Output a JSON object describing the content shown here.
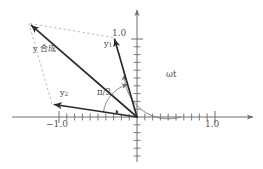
{
  "figure": {
    "type": "phasor-vector-diagram",
    "background": "#ffffff",
    "axis_color": "#6e6e6e",
    "vector_color": "#2b2b2b",
    "dashed_color": "#a9a9a9",
    "label_color": "#4a4a4a"
  },
  "axes": {
    "x_label_left": "−1.0",
    "x_label_right": "1.0",
    "y_label_top": "1.0",
    "origin_px": [
      137,
      117
    ],
    "unit_px": 78,
    "tick_spacing_px": 7.8,
    "x_range": [
      -1.62,
      1.6
    ],
    "y_range": [
      -0.64,
      1.36
    ],
    "grid": false
  },
  "vectors": [
    {
      "name": "y1",
      "label": "y",
      "subscript": "1",
      "from": [
        0,
        0
      ],
      "to": [
        -0.305,
        1.02
      ],
      "angle_deg": 106.6,
      "style": "solid",
      "label_px": [
        106,
        44
      ]
    },
    {
      "name": "y2",
      "label": "y",
      "subscript": "2",
      "from": [
        0,
        0
      ],
      "to": [
        -1.09,
        0.168
      ],
      "angle_deg": 171.2,
      "style": "solid",
      "label_px": [
        62,
        93
      ]
    },
    {
      "name": "y-resultant",
      "label": "y 合成",
      "subscript": "",
      "from": [
        0,
        0
      ],
      "to": [
        -1.385,
        1.2
      ],
      "angle_deg": 139.1,
      "style": "solid",
      "label_px": [
        36,
        48
      ]
    }
  ],
  "construction_lines": [
    {
      "name": "parallel-to-y2",
      "from": [
        -0.305,
        1.02
      ],
      "to": [
        -1.385,
        1.2
      ],
      "style": "dashed"
    },
    {
      "name": "parallel-to-y1",
      "from": [
        -1.09,
        0.168
      ],
      "to": [
        -1.385,
        1.2
      ],
      "style": "dashed"
    }
  ],
  "angles": [
    {
      "name": "pi-over-3",
      "label": "π/3",
      "label_px": [
        101,
        92
      ],
      "arc_radius_px": 34,
      "from_deg": 171.2,
      "to_deg": 106.6,
      "marker": "right-angle-tick"
    },
    {
      "name": "omega-t",
      "label": "ωt",
      "label_px": [
        168,
        74
      ],
      "arc_radius_px": 44,
      "from_deg": 0,
      "to_deg": 106.6
    }
  ],
  "ticks": {
    "x_major": [
      "−1.0",
      "1.0"
    ],
    "y_major": [
      "1.0"
    ],
    "minor_count_per_unit": 10
  }
}
